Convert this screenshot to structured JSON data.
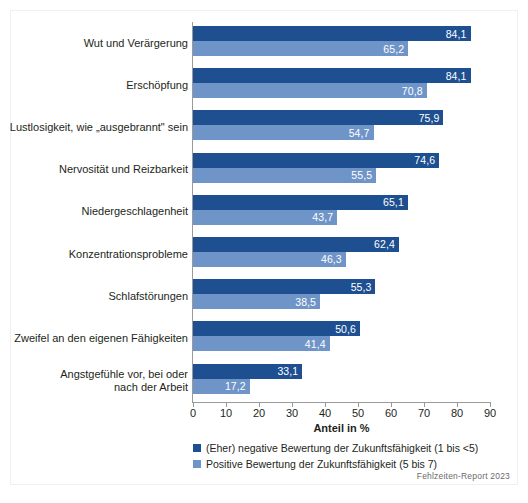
{
  "chart_data": {
    "type": "bar",
    "orientation": "horizontal",
    "title": "",
    "xlabel": "Anteil in %",
    "ylabel": "",
    "xlim": [
      0,
      90
    ],
    "xticks": [
      0,
      10,
      20,
      30,
      40,
      50,
      60,
      70,
      80,
      90
    ],
    "grid": false,
    "legend_position": "below-axis-left",
    "decimal_separator": ",",
    "categories": [
      "Wut und Verärgerung",
      "Erschöpfung",
      "Lustlosigkeit, wie „ausgebrannt\" sein",
      "Nervosität und Reizbarkeit",
      "Niedergeschlagenheit",
      "Konzentrationsprobleme",
      "Schlafstörungen",
      "Zweifel an den eigenen Fähigkeiten",
      "Angstgefühle vor, bei oder nach der Arbeit"
    ],
    "category_lines": [
      [
        "Wut und Verärgerung"
      ],
      [
        "Erschöpfung"
      ],
      [
        "Lustlosigkeit, wie „ausgebrannt\" sein"
      ],
      [
        "Nervosität und Reizbarkeit"
      ],
      [
        "Niedergeschlagenheit"
      ],
      [
        "Konzentrationsprobleme"
      ],
      [
        "Schlafstörungen"
      ],
      [
        "Zweifel an den eigenen Fähigkeiten"
      ],
      [
        "Angstgefühle vor, bei oder",
        "nach der Arbeit"
      ]
    ],
    "series": [
      {
        "name": "(Eher) negative Bewertung der Zukunftsfähigkeit (1 bis <5)",
        "color": "#1d4f91",
        "values": [
          84.1,
          84.1,
          75.9,
          74.6,
          65.1,
          62.4,
          55.3,
          50.6,
          33.1
        ],
        "labels": [
          "84,1",
          "84,1",
          "75,9",
          "74,6",
          "65,1",
          "62,4",
          "55,3",
          "50,6",
          "33,1"
        ]
      },
      {
        "name": "Positive Bewertung der Zukunftsfähigkeit (5 bis 7)",
        "color": "#6f94c8",
        "values": [
          65.2,
          70.8,
          54.7,
          55.5,
          43.7,
          46.3,
          38.5,
          41.4,
          17.2
        ],
        "labels": [
          "65,2",
          "70,8",
          "54,7",
          "55,5",
          "43,7",
          "46,3",
          "38,5",
          "41,4",
          "17,2"
        ]
      }
    ]
  },
  "axis": {
    "tick_labels": [
      "0",
      "10",
      "20",
      "30",
      "40",
      "50",
      "60",
      "70",
      "80",
      "90"
    ],
    "title": "Anteil in %"
  },
  "legend": {
    "items": [
      {
        "label": "(Eher) negative Bewertung der Zukunftsfähigkeit (1 bis <5)",
        "color": "#1d4f91"
      },
      {
        "label": "Positive Bewertung der Zukunftsfähigkeit (5 bis 7)",
        "color": "#6f94c8"
      }
    ]
  },
  "footer": {
    "source": "Fehlzeiten-Report 2023"
  },
  "colors": {
    "series_negative": "#1d4f91",
    "series_positive": "#6f94c8",
    "axis": "#9a9a9a",
    "text": "#231f20",
    "source_text": "#6b6b6b",
    "background": "#ffffff"
  }
}
